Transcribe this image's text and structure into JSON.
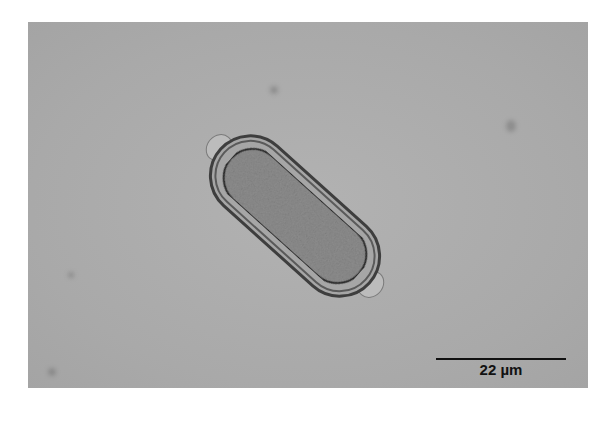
{
  "image": {
    "subject": "egg-micrograph",
    "background_color": "#aaaaaa",
    "page_color": "#ffffff"
  },
  "scale_bar": {
    "label": "22 µm"
  }
}
